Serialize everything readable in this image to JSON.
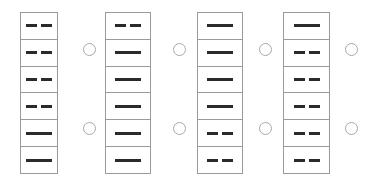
{
  "diagram": {
    "title": "",
    "background_color": "#ffffff",
    "border_color": "#9a9a9a",
    "mark_color": "#2b2b2b",
    "connector_color": "#a8a8a8",
    "columns": [
      {
        "name": "column-1",
        "x": 20,
        "y": 12,
        "width": 38,
        "height": 162,
        "cells": [
          {
            "mark": "broken"
          },
          {
            "mark": "broken"
          },
          {
            "mark": "broken"
          },
          {
            "mark": "broken"
          },
          {
            "mark": "solid"
          },
          {
            "mark": "solid"
          }
        ]
      },
      {
        "name": "column-2",
        "x": 105,
        "y": 12,
        "width": 46,
        "height": 162,
        "cells": [
          {
            "mark": "broken"
          },
          {
            "mark": "solid"
          },
          {
            "mark": "solid"
          },
          {
            "mark": "solid"
          },
          {
            "mark": "solid"
          },
          {
            "mark": "solid"
          }
        ]
      },
      {
        "name": "column-3",
        "x": 197,
        "y": 12,
        "width": 46,
        "height": 162,
        "cells": [
          {
            "mark": "solid"
          },
          {
            "mark": "solid"
          },
          {
            "mark": "solid"
          },
          {
            "mark": "solid"
          },
          {
            "mark": "broken"
          },
          {
            "mark": "broken"
          }
        ]
      },
      {
        "name": "column-4",
        "x": 283,
        "y": 12,
        "width": 47,
        "height": 162,
        "cells": [
          {
            "mark": "solid"
          },
          {
            "mark": "broken"
          },
          {
            "mark": "broken"
          },
          {
            "mark": "broken"
          },
          {
            "mark": "broken"
          },
          {
            "mark": "broken"
          }
        ]
      }
    ],
    "connectors": [
      {
        "name": "connector-gap1-upper",
        "x": 83,
        "y": 43
      },
      {
        "name": "connector-gap1-lower",
        "x": 83,
        "y": 122
      },
      {
        "name": "connector-gap2-upper",
        "x": 173,
        "y": 43
      },
      {
        "name": "connector-gap2-lower",
        "x": 173,
        "y": 122
      },
      {
        "name": "connector-gap3-upper",
        "x": 259,
        "y": 43
      },
      {
        "name": "connector-gap3-lower",
        "x": 259,
        "y": 122
      },
      {
        "name": "connector-gap4-upper",
        "x": 345,
        "y": 43
      },
      {
        "name": "connector-gap4-lower",
        "x": 345,
        "y": 122
      }
    ]
  }
}
